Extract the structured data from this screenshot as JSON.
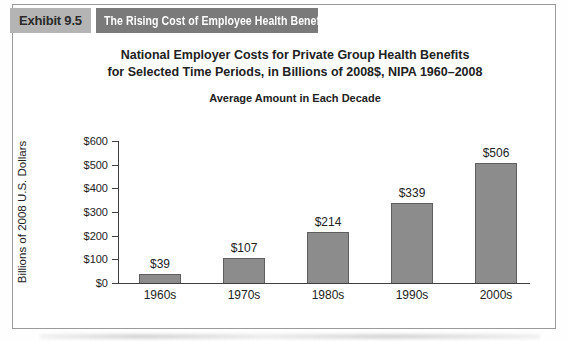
{
  "header": {
    "exhibit_label": "Exhibit 9.5",
    "exhibit_title": "The Rising Cost of Employee Health Benefits"
  },
  "chart_data": {
    "type": "bar",
    "title_line1": "National Employer Costs for Private Group Health Benefits",
    "title_line2": "for Selected Time Periods, in Billions of 2008$, NIPA 1960–2008",
    "subtitle": "Average Amount in Each Decade",
    "ylabel": "Billions of 2008 U.S. Dollars",
    "xlabel": "",
    "categories": [
      "1960s",
      "1970s",
      "1980s",
      "1990s",
      "2000s"
    ],
    "values": [
      39,
      107,
      214,
      339,
      506
    ],
    "value_labels": [
      "$39",
      "$107",
      "$214",
      "$339",
      "$506"
    ],
    "yticks": [
      0,
      100,
      200,
      300,
      400,
      500,
      600
    ],
    "ytick_labels": [
      "$0",
      "$100",
      "$200",
      "$300",
      "$400",
      "$500",
      "$600"
    ],
    "ylim": [
      0,
      600
    ],
    "grid": false,
    "legend": "none",
    "bar_color": "#8c8c8c",
    "bar_border_color": "#5f5f5f",
    "axis_color": "#3f3f3f"
  },
  "colors": {
    "badge_bg": "#b4b4b4",
    "banner_bg": "#7a7a7a",
    "banner_text": "#ffffff",
    "figure_border": "#9a9a9a",
    "text": "#222222"
  }
}
